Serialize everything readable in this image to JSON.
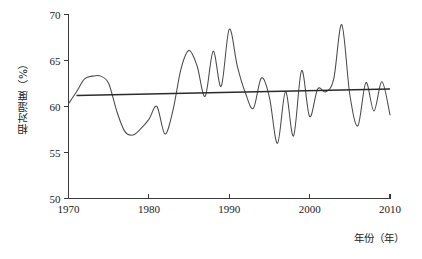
{
  "chart_data": {
    "type": "line",
    "title": "",
    "xlabel": "年份（年）",
    "ylabel": "相对湿度（%）",
    "xlim": [
      1970,
      2010
    ],
    "ylim": [
      50,
      70
    ],
    "grid": false,
    "legend": null,
    "x_ticks": [
      "1970",
      "1980",
      "1990",
      "2000",
      "2010"
    ],
    "x_tick_values": [
      1970,
      1980,
      1990,
      2000,
      2010
    ],
    "y_ticks": [
      "50",
      "55",
      "60",
      "65",
      "70"
    ],
    "y_tick_values": [
      50,
      55,
      60,
      65,
      70
    ],
    "x": [
      1970,
      1971,
      1972,
      1973,
      1974,
      1975,
      1976,
      1977,
      1978,
      1979,
      1980,
      1981,
      1982,
      1983,
      1984,
      1985,
      1986,
      1987,
      1988,
      1989,
      1990,
      1991,
      1992,
      1993,
      1994,
      1995,
      1996,
      1997,
      1998,
      1999,
      2000,
      2001,
      2002,
      2003,
      2004,
      2005,
      2006,
      2007,
      2008,
      2009,
      2010
    ],
    "series": [
      {
        "name": "相对湿度",
        "kind": "observed",
        "color": "#4a4a4a",
        "values": [
          60.3,
          61.6,
          63.0,
          63.3,
          63.3,
          62.5,
          59.5,
          57.3,
          56.9,
          57.6,
          58.6,
          60.0,
          57.0,
          59.6,
          64.1,
          66.1,
          64.4,
          61.1,
          66.0,
          62.2,
          68.4,
          64.4,
          61.5,
          59.8,
          63.1,
          61.0,
          56.0,
          61.6,
          56.8,
          63.9,
          58.9,
          61.9,
          61.6,
          63.0,
          68.9,
          61.3,
          57.9,
          62.6,
          59.5,
          62.7,
          59.1
        ]
      },
      {
        "name": "线性趋势",
        "kind": "trend",
        "color": "#2b2b2b",
        "x_range": [
          1971,
          2010
        ],
        "y_range": [
          61.2,
          61.9
        ]
      }
    ]
  },
  "axes": {
    "y_title": "相对湿度（%）",
    "x_title": "年份（年）"
  }
}
